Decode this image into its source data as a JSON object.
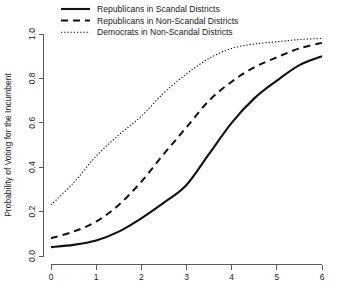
{
  "chart_data": {
    "type": "line",
    "title": "",
    "xlabel": "",
    "ylabel": "Probability of Voting for the Incumbent",
    "xlim": [
      0,
      6
    ],
    "ylim": [
      0,
      1
    ],
    "xticks": [
      "0",
      "1",
      "2",
      "3",
      "4",
      "5",
      "6"
    ],
    "yticks": [
      "0.0",
      "0.2",
      "0.4",
      "0.6",
      "0.8",
      "1.0"
    ],
    "grid": false,
    "legend_position": "top-left",
    "x": [
      0,
      0.5,
      1,
      1.5,
      2,
      2.5,
      3,
      3.5,
      4,
      4.5,
      5,
      5.5,
      6
    ],
    "series": [
      {
        "name": "Republicans in Scandal Districts",
        "style": "solid",
        "color": "#111111",
        "values": [
          0.04,
          0.05,
          0.07,
          0.11,
          0.17,
          0.24,
          0.32,
          0.46,
          0.6,
          0.71,
          0.79,
          0.86,
          0.9
        ]
      },
      {
        "name": "Republicans in Non-Scandal Districts",
        "style": "dashed",
        "color": "#111111",
        "values": [
          0.08,
          0.11,
          0.155,
          0.23,
          0.335,
          0.46,
          0.58,
          0.7,
          0.785,
          0.85,
          0.895,
          0.935,
          0.96
        ]
      },
      {
        "name": "Democrats in Non-Scandal Districts",
        "style": "dotted",
        "color": "#111111",
        "values": [
          0.23,
          0.33,
          0.45,
          0.545,
          0.63,
          0.735,
          0.82,
          0.89,
          0.935,
          0.955,
          0.965,
          0.975,
          0.98
        ]
      }
    ]
  },
  "legend": {
    "items": [
      {
        "label": "Republicans in Scandal Districts",
        "style": "solid"
      },
      {
        "label": "Republicans in Non-Scandal Districts",
        "style": "dashed"
      },
      {
        "label": "Democrats in Non-Scandal Districts",
        "style": "dotted"
      }
    ]
  },
  "axes": {
    "y_title": "Probability of Voting for the Incumbent",
    "x_title": ""
  }
}
